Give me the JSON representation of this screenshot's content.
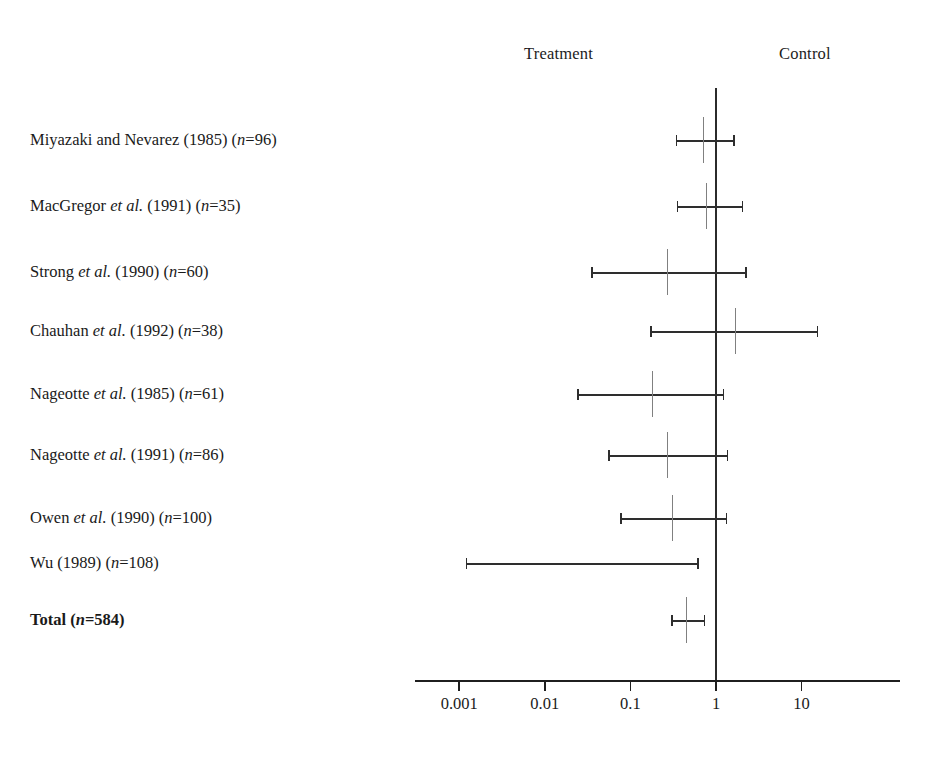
{
  "header": {
    "left_label": "Treatment",
    "right_label": "Control"
  },
  "chart_data": {
    "type": "forest",
    "title": "",
    "xlabel": "",
    "ylabel": "",
    "scale": "log10",
    "xlim": [
      0.0006,
      40
    ],
    "grid": false,
    "null_value": 1,
    "favors_left": "Treatment",
    "favors_right": "Control",
    "axis_ticks": [
      {
        "value": 0.001,
        "label": "0.001"
      },
      {
        "value": 0.01,
        "label": "0.01"
      },
      {
        "value": 0.1,
        "label": "0.1"
      },
      {
        "value": 1,
        "label": "1"
      },
      {
        "value": 10,
        "label": "10"
      }
    ],
    "rows": [
      {
        "label_parts": [
          {
            "t": "Miyazaki and Nevarez (1985) (",
            "i": false
          },
          {
            "t": "n",
            "i": true
          },
          {
            "t": "=96)",
            "i": false
          }
        ],
        "label": "Miyazaki and Nevarez (1985) (n=96)",
        "study": "Miyazaki and Nevarez",
        "year": 1985,
        "n": 96,
        "estimate": 0.72,
        "ci_low": 0.34,
        "ci_high": 1.58,
        "has_marker": true
      },
      {
        "label_parts": [
          {
            "t": "MacGregor ",
            "i": false
          },
          {
            "t": "et al.",
            "i": true
          },
          {
            "t": " (1991) (",
            "i": false
          },
          {
            "t": "n",
            "i": true
          },
          {
            "t": "=35)",
            "i": false
          }
        ],
        "label": "MacGregor et al. (1991) (n=35)",
        "study": "MacGregor et al.",
        "year": 1991,
        "n": 35,
        "estimate": 0.78,
        "ci_low": 0.35,
        "ci_high": 2.0,
        "has_marker": true
      },
      {
        "label_parts": [
          {
            "t": "Strong ",
            "i": false
          },
          {
            "t": "et al.",
            "i": true
          },
          {
            "t": " (1990) (",
            "i": false
          },
          {
            "t": "n",
            "i": true
          },
          {
            "t": "=60)",
            "i": false
          }
        ],
        "label": "Strong et al. (1990) (n=60)",
        "study": "Strong et al.",
        "year": 1990,
        "n": 60,
        "estimate": 0.27,
        "ci_low": 0.035,
        "ci_high": 2.2,
        "has_marker": true
      },
      {
        "label_parts": [
          {
            "t": "Chauhan ",
            "i": false
          },
          {
            "t": "et al.",
            "i": true
          },
          {
            "t": " (1992) (",
            "i": false
          },
          {
            "t": "n",
            "i": true
          },
          {
            "t": "=38)",
            "i": false
          }
        ],
        "label": "Chauhan et al. (1992) (n=38)",
        "study": "Chauhan et al.",
        "year": 1992,
        "n": 38,
        "estimate": 1.7,
        "ci_low": 0.17,
        "ci_high": 15.0,
        "has_marker": true
      },
      {
        "label_parts": [
          {
            "t": "Nageotte ",
            "i": false
          },
          {
            "t": "et al.",
            "i": true
          },
          {
            "t": " (1985) (",
            "i": false
          },
          {
            "t": "n",
            "i": true
          },
          {
            "t": "=61)",
            "i": false
          }
        ],
        "label": "Nageotte et al. (1985) (n=61)",
        "study": "Nageotte et al.",
        "year": 1985,
        "n": 61,
        "estimate": 0.18,
        "ci_low": 0.024,
        "ci_high": 1.2,
        "has_marker": true
      },
      {
        "label_parts": [
          {
            "t": "Nageotte ",
            "i": false
          },
          {
            "t": "et al.",
            "i": true
          },
          {
            "t": " (1991) (",
            "i": false
          },
          {
            "t": "n",
            "i": true
          },
          {
            "t": "=86)",
            "i": false
          }
        ],
        "label": "Nageotte et al. (1991) (n=86)",
        "study": "Nageotte et al.",
        "year": 1991,
        "n": 86,
        "estimate": 0.27,
        "ci_low": 0.055,
        "ci_high": 1.34,
        "has_marker": true
      },
      {
        "label_parts": [
          {
            "t": "Owen ",
            "i": false
          },
          {
            "t": "et al.",
            "i": true
          },
          {
            "t": " (1990) (",
            "i": false
          },
          {
            "t": "n",
            "i": true
          },
          {
            "t": "=100)",
            "i": false
          }
        ],
        "label": "Owen et al. (1990) (n=100)",
        "study": "Owen et al.",
        "year": 1990,
        "n": 100,
        "estimate": 0.31,
        "ci_low": 0.076,
        "ci_high": 1.3,
        "has_marker": true
      },
      {
        "label_parts": [
          {
            "t": "Wu (1989) (",
            "i": false
          },
          {
            "t": "n",
            "i": true
          },
          {
            "t": "=108)",
            "i": false
          }
        ],
        "label": "Wu (1989) (n=108)",
        "study": "Wu",
        "year": 1989,
        "n": 108,
        "estimate": null,
        "ci_low": 0.0012,
        "ci_high": 0.6,
        "has_marker": false
      },
      {
        "label_parts": [
          {
            "t": "Total (",
            "i": false
          },
          {
            "t": "n",
            "i": true
          },
          {
            "t": "=584)",
            "i": false
          }
        ],
        "label": "Total (n=584)",
        "study": "Total",
        "year": null,
        "n": 584,
        "estimate": 0.45,
        "ci_low": 0.3,
        "ci_high": 0.72,
        "has_marker": true,
        "is_total": true
      }
    ]
  },
  "geometry": {
    "x_at_value_1": 716,
    "px_per_decade": 85.6,
    "axis_left": 415,
    "axis_right": 900,
    "axis_y": 680,
    "null_line_top": 88,
    "null_line_bottom": 681,
    "row_y": [
      140,
      206,
      272,
      331,
      394,
      455,
      518,
      563,
      620
    ],
    "label_y": [
      132,
      198,
      264,
      323,
      386,
      447,
      510,
      555,
      612
    ]
  },
  "colors": {
    "ink": "#1a1a1a",
    "rule": "#2e2e2e",
    "marker": "#808080",
    "background": "#ffffff"
  }
}
